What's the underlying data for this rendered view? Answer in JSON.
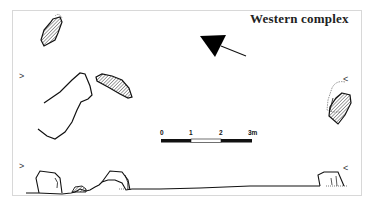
{
  "title": "Western complex",
  "scale_bar": {
    "ticks": [
      "0",
      "1",
      "2",
      "3m"
    ],
    "segments": [
      "black",
      "white",
      "black"
    ]
  },
  "markers": {
    "left_upper": ">",
    "left_lower": ">",
    "right_upper": "<",
    "right_lower": "<"
  },
  "north_arrow": {
    "color": "#000000"
  },
  "colors": {
    "line": "#111111",
    "frame": "#d8d8d8",
    "hatch": "#555555"
  }
}
